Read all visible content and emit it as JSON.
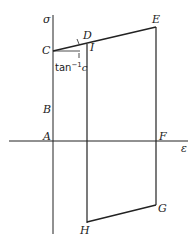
{
  "diagram": {
    "type": "stress-strain cycle",
    "axes": {
      "y_label": "σ",
      "x_label": "ε"
    },
    "points": {
      "A": "A",
      "B": "B",
      "C": "C",
      "D": "D",
      "E": "E",
      "F": "F",
      "G": "G",
      "H": "H",
      "I": "I"
    },
    "annotation": {
      "tan": "tan",
      "exp": "−1",
      "var": "c"
    },
    "colors": {
      "line": "#222222",
      "background": "#ffffff"
    }
  }
}
